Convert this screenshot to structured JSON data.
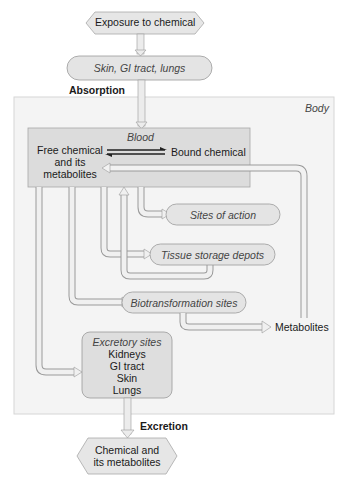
{
  "diagram": {
    "start_node": "Exposure to chemical",
    "entry_sites": "Skin, GI tract, lungs",
    "absorption_label": "Absorption",
    "body_label": "Body",
    "blood": {
      "title": "Blood",
      "free": [
        "Free chemical",
        "and its",
        "metabolites"
      ],
      "bound": "Bound chemical"
    },
    "sites_of_action": "Sites of action",
    "tissue_storage": "Tissue storage depots",
    "biotransformation": "Biotransformation sites",
    "metabolites": "Metabolites",
    "excretory": {
      "title": "Excretory sites",
      "items": [
        "Kidneys",
        "GI tract",
        "Skin",
        "Lungs"
      ]
    },
    "excretion_label": "Excretion",
    "end_node": [
      "Chemical and",
      "its metabolites"
    ]
  },
  "colors": {
    "node_fill": "#e4e4e4",
    "node_stroke": "#9a9a9a",
    "body_fill": "#f4f4f4",
    "blood_fill": "#dcdcdc",
    "arrow_fill": "#ececec",
    "arrow_stroke": "#8c8c8c"
  }
}
